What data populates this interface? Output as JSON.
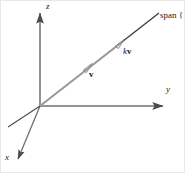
{
  "figure": {
    "kind": "3d-axes-vector-span-diagram",
    "width": 185,
    "height": 173,
    "background": "#ffffff",
    "border_color": "#e8e8e8"
  },
  "colors": {
    "axis": "#4a4a4a",
    "vector_gray": "#9a9a9a",
    "span_dark": "#3a3a3a",
    "text": "#1a1a1a"
  },
  "axes": {
    "origin": {
      "x": 40,
      "y": 106
    },
    "items": [
      {
        "name": "z-axis",
        "label": "z",
        "from": {
          "x": 40,
          "y": 106
        },
        "to": {
          "x": 40,
          "y": 10
        },
        "arrow": true
      },
      {
        "name": "y-axis",
        "label": "y",
        "from": {
          "x": 40,
          "y": 106
        },
        "to": {
          "x": 167,
          "y": 106
        },
        "arrow": true
      },
      {
        "name": "x-axis",
        "label": "x",
        "from": {
          "x": 40,
          "y": 106
        },
        "to": {
          "x": 16,
          "y": 163
        },
        "arrow": true
      },
      {
        "name": "negative-x-axis",
        "label": "",
        "from": {
          "x": 40,
          "y": 106
        },
        "to": {
          "x": 8,
          "y": 127
        },
        "arrow": false
      }
    ]
  },
  "vectors": [
    {
      "name": "vector-v",
      "label": "v",
      "scalar_prefix": "",
      "tail": {
        "x": 40,
        "y": 106
      },
      "head": {
        "x": 90,
        "y": 66
      },
      "color": "#9a9a9a",
      "label_pos": {
        "x": 89,
        "y": 70
      }
    },
    {
      "name": "vector-kv",
      "label": "v",
      "scalar_prefix": "k",
      "tail": {
        "x": 40,
        "y": 106
      },
      "head": {
        "x": 122,
        "y": 42
      },
      "color": "#9a9a9a",
      "label_pos": {
        "x": 123,
        "y": 47
      }
    }
  ],
  "span_line": {
    "name": "span-line",
    "from": {
      "x": 122,
      "y": 42
    },
    "to": {
      "x": 158,
      "y": 14
    },
    "color": "#3a3a3a",
    "label": "span {"
  },
  "labels": {
    "z": "z",
    "y": "y",
    "x": "x",
    "v": "v",
    "k": "k",
    "kv": "kv",
    "span": "span {"
  }
}
